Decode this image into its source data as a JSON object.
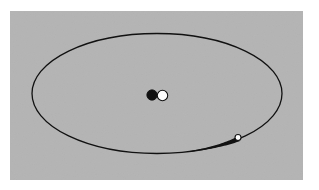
{
  "figure": {
    "background_color": "#ffffff",
    "panel": {
      "label": "diagram-panel",
      "fill_color": "#b4b4b4",
      "x": 10,
      "y": 11,
      "width": 293,
      "height": 169
    }
  },
  "chart_data": {
    "type": "scatter",
    "title": "",
    "subtitle": "",
    "xlabel": "",
    "ylabel": "",
    "grid": false,
    "legend_position": "none",
    "axis_visible": false,
    "tick_labels": [],
    "annotations": [],
    "xlim": [
      10,
      303
    ],
    "ylim": [
      11,
      180
    ],
    "series": [
      {
        "name": "orbit-ellipse",
        "type": "ellipse-path",
        "stroke_color": "#111111",
        "stroke_width": 1.3,
        "center_x": 157,
        "center_y": 93.5,
        "radius_x": 125,
        "radius_y": 60,
        "rotation_deg": 0,
        "closed": true
      },
      {
        "name": "primary-body",
        "type": "point",
        "marker": "filled-circle",
        "fill_color": "#111111",
        "stroke_color": "#111111",
        "x": 152,
        "y": 95,
        "radius": 5.2
      },
      {
        "name": "secondary-body",
        "type": "point",
        "marker": "open-circle",
        "fill_color": "#ffffff",
        "stroke_color": "#111111",
        "x": 162.5,
        "y": 95.5,
        "radius": 5.2
      },
      {
        "name": "orbiting-object",
        "type": "point",
        "marker": "open-circle",
        "fill_color": "#ffffff",
        "stroke_color": "#111111",
        "x": 238,
        "y": 137.5,
        "radius": 3.0
      },
      {
        "name": "motion-tail",
        "type": "tapered-trail",
        "fill_color": "#111111",
        "start_x": 186,
        "start_y": 148.5,
        "end_x": 236,
        "end_y": 137.5,
        "start_width": 0.8,
        "end_width": 5.0
      }
    ]
  }
}
